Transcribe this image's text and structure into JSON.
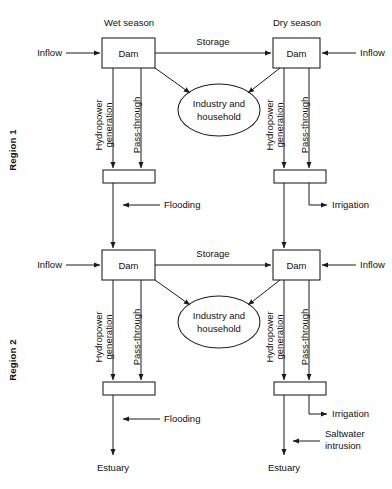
{
  "diagram": {
    "colors": {
      "stroke": "#1b1b1b",
      "background": "#ffffff",
      "text": "#111111"
    },
    "region_labels": [
      {
        "id": "region-1",
        "text": "Region 1"
      },
      {
        "id": "region-2",
        "text": "Region 2"
      }
    ],
    "season_headers": [
      {
        "id": "wet-season",
        "text": "Wet season"
      },
      {
        "id": "dry-season",
        "text": "Dry season"
      }
    ],
    "nodes": {
      "dam": "Dam",
      "industry_household_line1": "Industry and",
      "industry_household_line2": "household",
      "estuary": "Estuary"
    },
    "flows": {
      "inflow": "Inflow",
      "storage": "Storage",
      "hydropower_line1": "Hydropower",
      "hydropower_line2": "generation",
      "pass_through": "Pass-through",
      "flooding": "Flooding",
      "irrigation": "Irrigation",
      "saltwater_line1": "Saltwater",
      "saltwater_line2": "intrusion"
    }
  }
}
